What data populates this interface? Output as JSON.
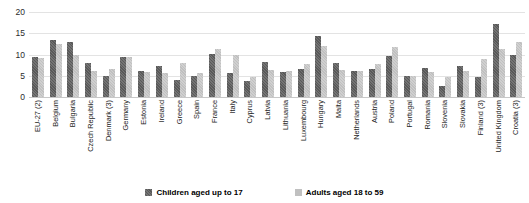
{
  "chart_data": {
    "type": "bar",
    "title": "",
    "subtitle": "",
    "xlabel": "",
    "ylabel": "",
    "ylim": [
      0,
      20
    ],
    "yticks": [
      0,
      5,
      10,
      15,
      20
    ],
    "grid": true,
    "legend_position": "bottom",
    "categories": [
      "EU-27 (2)",
      "Belgium",
      "Bulgaria",
      "Czech Republic",
      "Denmark (3)",
      "Germany",
      "Estonia",
      "Ireland",
      "Greece",
      "Spain",
      "France",
      "Italy",
      "Cyprus",
      "Latvia",
      "Lithuania",
      "Luxembourg",
      "Hungary",
      "Malta",
      "Netherlands",
      "Austria",
      "Poland",
      "Portugal",
      "Romania",
      "Slovenia",
      "Slovakia",
      "Finland (3)",
      "United Kingdom",
      "Croatia (3)"
    ],
    "series": [
      {
        "name": "Children aged up to 17",
        "color": "#595959",
        "values": [
          9.4,
          13.4,
          12.9,
          7.9,
          4.9,
          9.3,
          6.1,
          7.2,
          3.9,
          4.9,
          10.1,
          5.6,
          3.7,
          8.3,
          6.0,
          6.6,
          14.3,
          8.1,
          6.1,
          6.5,
          9.7,
          4.9,
          6.8,
          2.7,
          7.2,
          4.6,
          17.1,
          10.0
        ]
      },
      {
        "name": "Adults aged 18 to 59",
        "color": "#c0c0c0",
        "values": [
          9.2,
          12.4,
          9.9,
          6.2,
          6.7,
          9.3,
          5.9,
          5.7,
          7.9,
          5.6,
          11.3,
          10.0,
          4.7,
          6.3,
          6.1,
          7.7,
          12.0,
          6.3,
          6.1,
          7.8,
          11.8,
          4.9,
          5.9,
          4.7,
          6.1,
          8.9,
          11.4,
          13.0
        ]
      }
    ]
  },
  "legend": {
    "items": [
      {
        "label": "Children aged up to 17"
      },
      {
        "label": "Adults aged 18 to 59"
      }
    ]
  }
}
